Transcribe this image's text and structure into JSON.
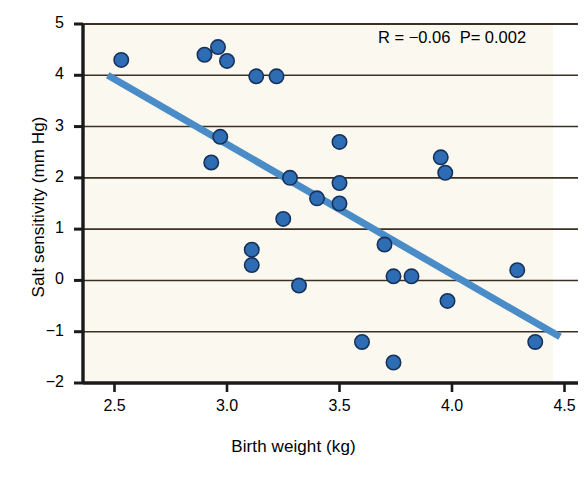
{
  "chart_data": {
    "type": "scatter",
    "title": "",
    "xlabel": "Birth weight (kg)",
    "ylabel": "Salt sensitivity (mm Hg)",
    "xlim": [
      2.36,
      4.56
    ],
    "ylim": [
      -2,
      5
    ],
    "xticks": [
      "2.5",
      "3.0",
      "3.5",
      "4.0",
      "4.5"
    ],
    "xtick_values": [
      2.5,
      3.0,
      3.5,
      4.0,
      4.5
    ],
    "yticks": [
      "5",
      "4",
      "3",
      "2",
      "1",
      "0",
      "−1",
      "−2"
    ],
    "ytick_values": [
      5,
      4,
      3,
      2,
      1,
      0,
      -1,
      -2
    ],
    "grid": "horizontal",
    "legend": "none",
    "annotation": "R = −0.06  P= 0.002",
    "annotation_parts": {
      "r_label": "R = −0.06",
      "p_label": "P= 0.002"
    },
    "marker_color": "#2E6DB4",
    "marker_edge_color": "#16325c",
    "trendline_color": "#4A8CC7",
    "plot_background": "#faf8ef",
    "points": [
      {
        "x": 2.53,
        "y": 4.3
      },
      {
        "x": 2.9,
        "y": 4.4
      },
      {
        "x": 2.96,
        "y": 4.55
      },
      {
        "x": 3.0,
        "y": 4.28
      },
      {
        "x": 3.13,
        "y": 3.98
      },
      {
        "x": 3.22,
        "y": 3.98
      },
      {
        "x": 2.97,
        "y": 2.8
      },
      {
        "x": 2.93,
        "y": 2.3
      },
      {
        "x": 3.5,
        "y": 2.7
      },
      {
        "x": 3.95,
        "y": 2.4
      },
      {
        "x": 3.97,
        "y": 2.1
      },
      {
        "x": 3.28,
        "y": 2.0
      },
      {
        "x": 3.5,
        "y": 1.9
      },
      {
        "x": 3.4,
        "y": 1.6
      },
      {
        "x": 3.5,
        "y": 1.5
      },
      {
        "x": 3.25,
        "y": 1.2
      },
      {
        "x": 3.7,
        "y": 0.7
      },
      {
        "x": 3.11,
        "y": 0.6
      },
      {
        "x": 3.11,
        "y": 0.3
      },
      {
        "x": 4.29,
        "y": 0.2
      },
      {
        "x": 3.74,
        "y": 0.08
      },
      {
        "x": 3.82,
        "y": 0.08
      },
      {
        "x": 3.32,
        "y": -0.1
      },
      {
        "x": 3.98,
        "y": -0.4
      },
      {
        "x": 3.6,
        "y": -1.2
      },
      {
        "x": 4.37,
        "y": -1.2
      },
      {
        "x": 3.74,
        "y": -1.6
      }
    ],
    "trendline": {
      "x0": 2.47,
      "y0": 4.0,
      "x1": 4.48,
      "y1": -1.1
    }
  }
}
